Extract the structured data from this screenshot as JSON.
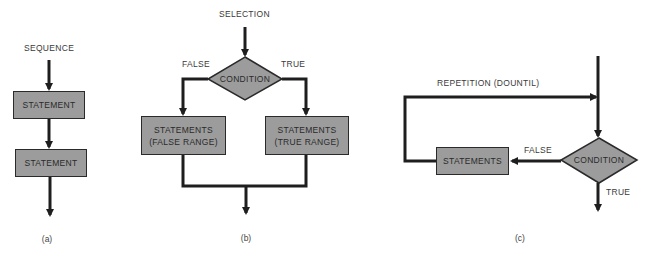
{
  "panels": {
    "a": {
      "title": "SEQUENCE",
      "statements": [
        "STATEMENT",
        "STATEMENT"
      ],
      "caption": "(a)"
    },
    "b": {
      "title": "SELECTION",
      "condition": "CONDITION",
      "false_label": "FALSE",
      "true_label": "TRUE",
      "false_box": [
        "STATEMENTS",
        "(FALSE RANGE)"
      ],
      "true_box": [
        "STATEMENTS",
        "(TRUE RANGE)"
      ],
      "caption": "(b)"
    },
    "c": {
      "title": "REPETITION  (DOUNTIL)",
      "condition": "CONDITION",
      "false_label": "FALSE",
      "true_label": "TRUE",
      "statements": "STATEMENTS",
      "caption": "(c)"
    }
  },
  "colors": {
    "box_fill": "#9c9c9c",
    "line": "#1e1e1e",
    "text": "#3a3a3a"
  }
}
